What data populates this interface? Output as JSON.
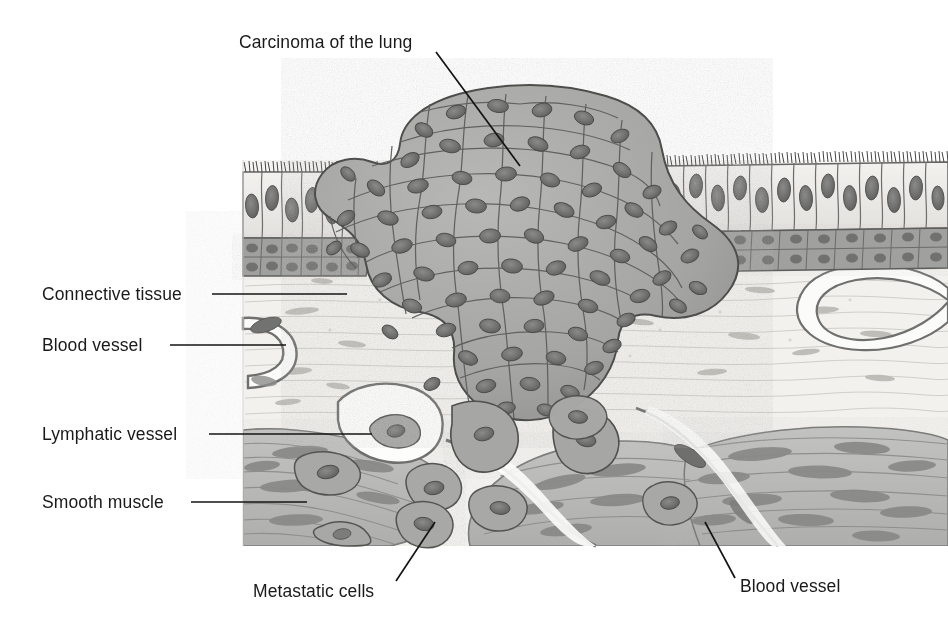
{
  "figure": {
    "background_color": "#ffffff",
    "width": 948,
    "height": 625
  },
  "labels": [
    {
      "id": "carcinoma-of-the-lung",
      "text": "Carcinoma of the lung",
      "text_x": 239,
      "text_y": 48,
      "anchor": "start",
      "leader": "M 436,52 L 520,166",
      "target": "tumor-mass"
    },
    {
      "id": "connective-tissue",
      "text": "Connective tissue",
      "text_x": 42,
      "text_y": 300,
      "anchor": "start",
      "leader": "M 212,294 L 347,294",
      "target": "connective-tissue-layer"
    },
    {
      "id": "blood-vessel-left",
      "text": "Blood vessel",
      "text_x": 42,
      "text_y": 351,
      "anchor": "start",
      "leader": "M 170,345 L 286,345",
      "target": "blood-vessel-lumen-left"
    },
    {
      "id": "lymphatic-vessel",
      "text": "Lymphatic vessel",
      "text_x": 42,
      "text_y": 440,
      "anchor": "start",
      "leader": "M 209,434 L 372,434",
      "target": "lymphatic-vessel-lumen"
    },
    {
      "id": "smooth-muscle",
      "text": "Smooth muscle",
      "text_x": 42,
      "text_y": 508,
      "anchor": "start",
      "leader": "M 191,502 L 307,502",
      "target": "smooth-muscle-layer"
    },
    {
      "id": "metastatic-cells",
      "text": "Metastatic cells",
      "text_x": 253,
      "text_y": 597,
      "anchor": "start",
      "leader": "M 396,581 L 435,522",
      "target": "metastatic-cell"
    },
    {
      "id": "blood-vessel-right",
      "text": "Blood vessel",
      "text_x": 740,
      "text_y": 592,
      "anchor": "start",
      "leader": "M 735,578 L 705,522",
      "target": "blood-vessel-right-wall"
    }
  ],
  "tissue_layers": [
    {
      "id": "ciliated-epithelium",
      "name": "Ciliated columnar epithelium",
      "fill": "#eceae6",
      "outline": "#4a4a4a"
    },
    {
      "id": "basal-cell-layer",
      "name": "Basal cell layer",
      "fill": "#9e9e9c",
      "outline": "#555555"
    },
    {
      "id": "connective-tissue-layer",
      "name": "Connective tissue",
      "fill": "#f4f3f0",
      "outline": "#b4b2ad"
    },
    {
      "id": "smooth-muscle-layer",
      "name": "Smooth muscle",
      "fill": "#b7b7b5",
      "outline": "#6e6e6c"
    },
    {
      "id": "tumor-mass",
      "name": "Carcinoma cell mass",
      "fill": "#a6a6a4",
      "outline": "#4f4f4f"
    },
    {
      "id": "nucleus",
      "name": "Cell nucleus",
      "fill": "#747472",
      "outline": "#4b4b4b"
    }
  ],
  "colors": {
    "ink": "#1a1a1a",
    "leader": "#141414",
    "page_background": "#ffffff",
    "tumor_cytoplasm": "#a6a6a4",
    "tumor_nucleus": "#6e6e6c",
    "epithelium_cytoplasm": "#eceae6",
    "basal_layer": "#9e9e9c",
    "connective_tissue": "#f4f3f0",
    "smooth_muscle": "#b7b7b5",
    "vessel_wall": "#7d7d7b",
    "lumen": "#fbfbfa"
  }
}
